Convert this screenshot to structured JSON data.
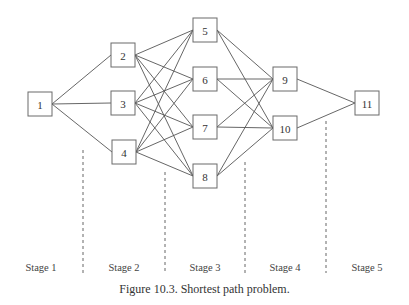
{
  "figure": {
    "caption": "Figure 10.3. Shortest path problem."
  },
  "nodes": [
    {
      "id": "1",
      "label": "1",
      "x": 40,
      "y": 104,
      "stage": 1
    },
    {
      "id": "2",
      "label": "2",
      "x": 123,
      "y": 55,
      "stage": 2
    },
    {
      "id": "3",
      "label": "3",
      "x": 123,
      "y": 103,
      "stage": 2
    },
    {
      "id": "4",
      "label": "4",
      "x": 124,
      "y": 152,
      "stage": 2
    },
    {
      "id": "5",
      "label": "5",
      "x": 205,
      "y": 30,
      "stage": 3
    },
    {
      "id": "6",
      "label": "6",
      "x": 205,
      "y": 79,
      "stage": 3
    },
    {
      "id": "7",
      "label": "7",
      "x": 205,
      "y": 127,
      "stage": 3
    },
    {
      "id": "8",
      "label": "8",
      "x": 205,
      "y": 176,
      "stage": 3
    },
    {
      "id": "9",
      "label": "9",
      "x": 285,
      "y": 79,
      "stage": 4
    },
    {
      "id": "10",
      "label": "10",
      "x": 285,
      "y": 128,
      "stage": 4
    },
    {
      "id": "11",
      "label": "11",
      "x": 367,
      "y": 103,
      "stage": 5
    }
  ],
  "edges": [
    [
      "1",
      "2"
    ],
    [
      "1",
      "3"
    ],
    [
      "1",
      "4"
    ],
    [
      "2",
      "5"
    ],
    [
      "2",
      "6"
    ],
    [
      "2",
      "7"
    ],
    [
      "2",
      "8"
    ],
    [
      "3",
      "5"
    ],
    [
      "3",
      "6"
    ],
    [
      "3",
      "7"
    ],
    [
      "3",
      "8"
    ],
    [
      "4",
      "5"
    ],
    [
      "4",
      "6"
    ],
    [
      "4",
      "7"
    ],
    [
      "4",
      "8"
    ],
    [
      "5",
      "9"
    ],
    [
      "5",
      "10"
    ],
    [
      "6",
      "9"
    ],
    [
      "6",
      "10"
    ],
    [
      "7",
      "9"
    ],
    [
      "7",
      "10"
    ],
    [
      "8",
      "9"
    ],
    [
      "8",
      "10"
    ],
    [
      "9",
      "11"
    ],
    [
      "10",
      "11"
    ]
  ],
  "dividers": [
    {
      "x": 83,
      "y1": 150,
      "y2": 273
    },
    {
      "x": 165,
      "y1": 172,
      "y2": 273
    },
    {
      "x": 245,
      "y1": 162,
      "y2": 273
    },
    {
      "x": 326,
      "y1": 121,
      "y2": 273
    }
  ],
  "stages": [
    {
      "label": "Stage 1",
      "x": 41
    },
    {
      "label": "Stage 2",
      "x": 124
    },
    {
      "label": "Stage 3",
      "x": 205
    },
    {
      "label": "Stage 4",
      "x": 285
    },
    {
      "label": "Stage 5",
      "x": 367
    }
  ],
  "style": {
    "box_size": 24
  }
}
